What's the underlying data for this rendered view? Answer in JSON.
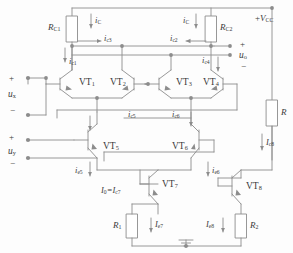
{
  "diagram": {
    "type": "schematic",
    "line_color": "#8c8c8c",
    "text_color": "#3a3a3a",
    "background": "#fdfdfd"
  },
  "supply": {
    "label_plus": "+",
    "label_v": "V",
    "label_sub": "CC",
    "full": "+VCC"
  },
  "inputs": {
    "x": {
      "name": "u",
      "sub": "x",
      "plus": "+",
      "minus": "−"
    },
    "y": {
      "name": "u",
      "sub": "y",
      "plus": "+",
      "minus": "−"
    }
  },
  "output": {
    "name": "u",
    "sub": "o",
    "plus": "+",
    "minus": "−"
  },
  "resistors": [
    {
      "id": "RC1",
      "name": "R",
      "sub": "C1"
    },
    {
      "id": "RC2",
      "name": "R",
      "sub": "C2"
    },
    {
      "id": "R",
      "name": "R",
      "sub": ""
    },
    {
      "id": "R1",
      "name": "R",
      "sub": "1"
    },
    {
      "id": "R2",
      "name": "R",
      "sub": "2"
    }
  ],
  "transistors": [
    {
      "id": "VT1",
      "name": "VT",
      "sub": "1"
    },
    {
      "id": "VT2",
      "name": "VT",
      "sub": "2"
    },
    {
      "id": "VT3",
      "name": "VT",
      "sub": "3"
    },
    {
      "id": "VT4",
      "name": "VT",
      "sub": "4"
    },
    {
      "id": "VT5",
      "name": "VT",
      "sub": "5"
    },
    {
      "id": "VT6",
      "name": "VT",
      "sub": "6"
    },
    {
      "id": "VT7",
      "name": "VT",
      "sub": "7"
    },
    {
      "id": "VT8",
      "name": "VT",
      "sub": "8"
    }
  ],
  "currents": [
    {
      "id": "iC_left",
      "name": "i",
      "sub": "C"
    },
    {
      "id": "iC_right",
      "name": "i",
      "sub": "C"
    },
    {
      "id": "ic1",
      "name": "i",
      "sub": "c1"
    },
    {
      "id": "ic2",
      "name": "i",
      "sub": "c2"
    },
    {
      "id": "ic3",
      "name": "i",
      "sub": "c3"
    },
    {
      "id": "ic4",
      "name": "i",
      "sub": "c4"
    },
    {
      "id": "ic5",
      "name": "i",
      "sub": "c5"
    },
    {
      "id": "ic6",
      "name": "i",
      "sub": "c6"
    },
    {
      "id": "ie5",
      "name": "i",
      "sub": "e5"
    },
    {
      "id": "ie6",
      "name": "i",
      "sub": "e6"
    },
    {
      "id": "Ic8",
      "name": "I",
      "sub": "c8"
    },
    {
      "id": "Ie7",
      "name": "I",
      "sub": "e7"
    },
    {
      "id": "Ie8",
      "name": "I",
      "sub": "e8"
    }
  ],
  "annotations": {
    "tail_current": "I0=Ic7",
    "tail_current_parts": {
      "lead": "I",
      "lead_sub": "0",
      "eq": "=",
      "tail": "I",
      "tail_sub": "c7"
    }
  },
  "ground": {
    "name": "ground-symbol"
  }
}
